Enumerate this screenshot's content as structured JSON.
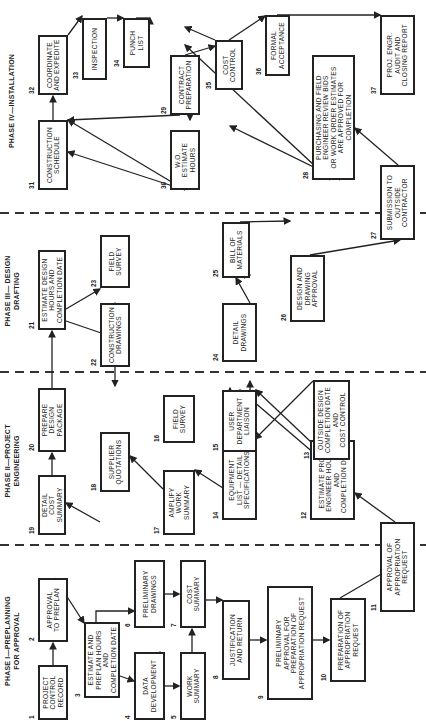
{
  "phases": [
    {
      "id": "phase1",
      "label": "PHASE I—PREPLANNING\nFOR APPROVAL"
    },
    {
      "id": "phase2",
      "label": "PHASE II—PROJECT\nENGINEERING"
    },
    {
      "id": "phase3",
      "label": "PHASE III— DESIGN\nDRAFTING"
    },
    {
      "id": "phase4",
      "label": "PHASE IV—INSTALLATION"
    }
  ],
  "boxes": [
    {
      "n": "1",
      "text": "PROJECT\nCONTROL\nRECORD"
    },
    {
      "n": "2",
      "text": "APPROVAL\nTO PREPLAN"
    },
    {
      "n": "3",
      "text": "ESTIMATE AND\nPREPLAN HOURS AND\nCOMPLETION DATE"
    },
    {
      "n": "4",
      "text": "DATA\nDEVELOPMENT"
    },
    {
      "n": "5",
      "text": "WORK\nSUMMARY"
    },
    {
      "n": "6",
      "text": "PRELIMINARY\nDRAWINGS"
    },
    {
      "n": "7",
      "text": "COST\nSUMMARY"
    },
    {
      "n": "8",
      "text": "JUSTIFICATION\nAND RETURN"
    },
    {
      "n": "9",
      "text": "PRELIMINARY\nAPPROVAL FOR\nPREPARATION OF\nAPPROPRIATION REQUEST"
    },
    {
      "n": "10",
      "text": "PREPARATION OF\nAPPROPRIATION\nREQUEST"
    },
    {
      "n": "11",
      "text": "APPROVAL OF\nAPPROPRIATION\nREQUEST"
    },
    {
      "n": "12",
      "text": "ESTIMATE PROJ.\nENGINEER HOURS\nAND\nCOMPLETION DATE"
    },
    {
      "n": "13",
      "text": "OUTSIDE DESIGN\nCOMPLETION DATE\nAND\nCOST CONTROL"
    },
    {
      "n": "14",
      "text": "EQUIPMENT\nLIST — DETAIL\nSPECIFICATIONS"
    },
    {
      "n": "15",
      "text": "USER\nDEPARTMENT\nLIAISON"
    },
    {
      "n": "16",
      "text": "FIELD\nSURVEY"
    },
    {
      "n": "17",
      "text": "AMPLIFY\nWORK\nSUMMARY"
    },
    {
      "n": "18",
      "text": "SUPPLIER\nQUOTATIONS"
    },
    {
      "n": "19",
      "text": "DETAIL\nCOST\nSUMMARY"
    },
    {
      "n": "20",
      "text": "PREPARE\nDESIGN\nPACKAGE"
    },
    {
      "n": "21",
      "text": "ESTIMATE DESIGN\nHOURS AND\nCOMPLETION DATE"
    },
    {
      "n": "22",
      "text": "CONSTRUCTION\nDRAWINGS"
    },
    {
      "n": "23",
      "text": "FIELD\nSURVEY"
    },
    {
      "n": "24",
      "text": "DETAIL\nDRAWINGS"
    },
    {
      "n": "25",
      "text": "BILL OF\nMATERIALS"
    },
    {
      "n": "26",
      "text": "DESIGN AND\nDRAWING\nAPPROVAL"
    },
    {
      "n": "27",
      "text": "SUBMISSION TO\nOUTSIDE\nCONTRACTOR"
    },
    {
      "n": "28",
      "text": "PURCHASING AND FIELD\nENGINEER REVIEW BIDS\nOR WORK ORDER ESTIMATES\nARE APPROVED FOR COMPLETION"
    },
    {
      "n": "29",
      "text": "CONTRACT\nPREPARATION"
    },
    {
      "n": "30",
      "text": "W.O.\nESTIMATE\nHOURS"
    },
    {
      "n": "31",
      "text": "CONSTRUCTION\nSCHEDULE"
    },
    {
      "n": "32",
      "text": "COORDINATE\nAND EXPEDITE"
    },
    {
      "n": "33",
      "text": "INSPECTION"
    },
    {
      "n": "34",
      "text": "PUNCH\nLIST"
    },
    {
      "n": "35",
      "text": "COST\nCONTROL"
    },
    {
      "n": "36",
      "text": "FORMAL\nACCEPTANCE"
    },
    {
      "n": "37",
      "text": "PROJ. ENGR.\nAUDIT AND\nCLOSING REPORT"
    }
  ]
}
